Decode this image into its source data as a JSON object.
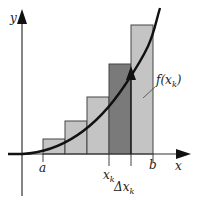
{
  "diagram": {
    "type": "riemann-sum",
    "labels": {
      "y_axis": "y",
      "x_axis": "x",
      "a": "a",
      "b": "b",
      "xk_base": "x",
      "xk_sub": "k",
      "dx_base": "Δx",
      "dx_sub": "k",
      "fxk": "f(x",
      "fxk_sub": "k",
      "fxk_close": ")"
    },
    "colors": {
      "bar_fill": "#c4c4c4",
      "highlight_bar_fill": "#7a7a7a",
      "curve": "#111111",
      "axis": "#333333"
    },
    "bars": [
      {
        "x": 43,
        "top": 139,
        "width": 22
      },
      {
        "x": 65,
        "top": 121,
        "width": 22
      },
      {
        "x": 87,
        "top": 97,
        "width": 22
      },
      {
        "x": 109,
        "top": 64,
        "width": 22,
        "highlight": true
      },
      {
        "x": 131,
        "top": 25,
        "width": 22
      }
    ]
  }
}
